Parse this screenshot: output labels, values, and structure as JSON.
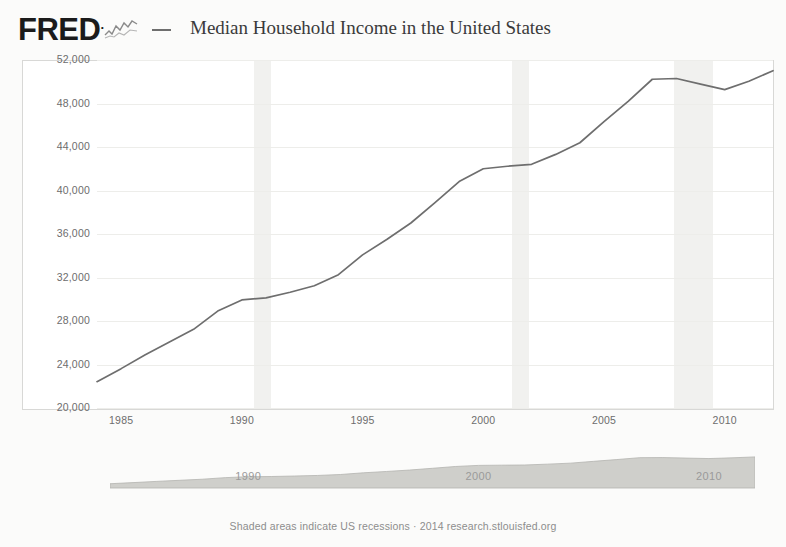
{
  "header": {
    "logo_text": "FRED",
    "logo_mark": "squiggle-chart-icon",
    "legend_dash": "series-legend-line",
    "title": "Median Household Income in the United States"
  },
  "footer": {
    "note": "Shaded areas indicate US recessions · 2014 research.stlouisfed.org"
  },
  "navigator": {
    "labels": [
      "1990",
      "2000",
      "2010"
    ]
  },
  "chart_data": {
    "type": "line",
    "title": "Median Household Income in the United States",
    "xlabel": "",
    "ylabel": "",
    "ylim": [
      20000,
      52000
    ],
    "xlim": [
      1984,
      2012
    ],
    "ytick_labels": [
      "52,000",
      "48,000",
      "44,000",
      "40,000",
      "36,000",
      "32,000",
      "28,000",
      "24,000",
      "20,000"
    ],
    "yticks": [
      52000,
      48000,
      44000,
      40000,
      36000,
      32000,
      28000,
      24000,
      20000
    ],
    "xtick_labels": [
      "1985",
      "1990",
      "1995",
      "2000",
      "2005",
      "2010"
    ],
    "xticks": [
      1985,
      1990,
      1995,
      2000,
      2005,
      2010
    ],
    "grid": true,
    "legend": [],
    "line_color": "#6e6e6e",
    "recession_bands": [
      [
        1990.5,
        1991.2
      ],
      [
        2001.2,
        2001.9
      ],
      [
        2007.9,
        2009.5
      ]
    ],
    "x": [
      1984,
      1985,
      1986,
      1987,
      1988,
      1989,
      1990,
      1991,
      1992,
      1993,
      1994,
      1995,
      1996,
      1997,
      1998,
      1999,
      2000,
      2001,
      2002,
      2003,
      2004,
      2005,
      2006,
      2007,
      2008,
      2009,
      2010,
      2011,
      2012
    ],
    "values": [
      22420,
      23620,
      24900,
      26060,
      27230,
      28910,
      29940,
      30130,
      30640,
      31240,
      32260,
      34080,
      35490,
      37010,
      38890,
      40820,
      42000,
      42230,
      42410,
      43320,
      44390,
      46330,
      48200,
      50230,
      50300,
      49780,
      49280,
      50050,
      51020
    ],
    "series": [
      {
        "name": "Median Household Income in the United States",
        "values": [
          22420,
          23620,
          24900,
          26060,
          27230,
          28910,
          29940,
          30130,
          30640,
          31240,
          32260,
          34080,
          35490,
          37010,
          38890,
          40820,
          42000,
          42230,
          42410,
          43320,
          44390,
          46330,
          48200,
          50230,
          50300,
          49780,
          49280,
          50050,
          51020
        ]
      }
    ]
  }
}
